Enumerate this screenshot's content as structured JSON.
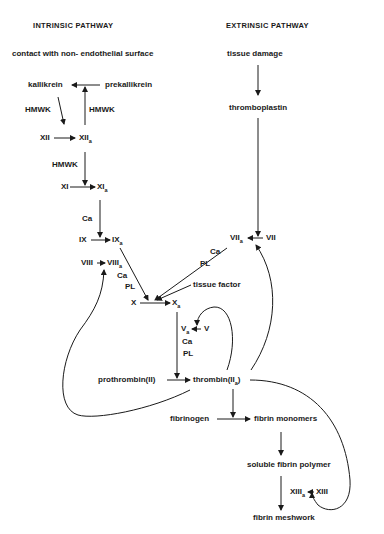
{
  "headers": {
    "intrinsic": "INTRINSIC PATHWAY",
    "extrinsic": "EXTRINSIC PATHWAY"
  },
  "intrinsic": {
    "trigger": "contact with non- endothelial surface",
    "kallikrein": "kallikrein",
    "prekallikrein": "prekallikrein",
    "hmwk1": "HMWK",
    "hmwk2": "HMWK",
    "xii": "XII",
    "xiia": "XII",
    "xiia_sub": "a",
    "hmwk3": "HMWK",
    "xi": "XI",
    "xia": "XI",
    "xia_sub": "a",
    "ca1": "Ca",
    "ix": "IX",
    "ixa": "IX",
    "ixa_sub": "a",
    "viii": "VIII",
    "viiia": "VIII",
    "viiia_sub": "a",
    "ca2": "Ca",
    "pl1": "PL"
  },
  "extrinsic": {
    "trigger": "tissue damage",
    "thromboplastin": "thromboplastin",
    "viia": "VII",
    "viia_sub": "a",
    "vii": "VII",
    "ca": "Ca",
    "pl": "PL",
    "tissue_factor": "tissue factor"
  },
  "common": {
    "x": "X",
    "xa": "X",
    "xa_sub": "a",
    "va": "V",
    "va_sub": "a",
    "v": "V",
    "ca": "Ca",
    "pl": "PL",
    "prothrombin": "prothrombin(II)",
    "thrombin": "thrombin(II",
    "thrombin_sub": "a",
    "thrombin_close": ")",
    "fibrinogen": "fibrinogen",
    "fibrin_monomers": "fibrin monomers",
    "soluble_fibrin_polymer": "soluble fibrin polymer",
    "xiiia": "XIII",
    "xiiia_sub": "a",
    "xiii": "XIII",
    "fibrin_meshwork": "fibrin meshwork"
  }
}
